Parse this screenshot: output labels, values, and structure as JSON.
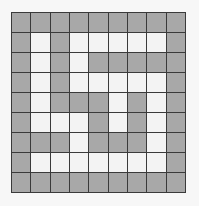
{
  "maze": {
    "rows": 9,
    "cols": 9,
    "colors": {
      "wall": "#a8a8a8",
      "path": "#f3f3f3",
      "grid_line": "#3a3a3a"
    },
    "grid": [
      "GGGGGGGGG",
      "GWGWWWWWG",
      "GWGWGGGGG",
      "GWGWWWWWG",
      "GWGGGWGWG",
      "GWWWGWGWG",
      "GGGWGGGWG",
      "GWWWWWWWG",
      "GGGGGGGGG"
    ]
  }
}
